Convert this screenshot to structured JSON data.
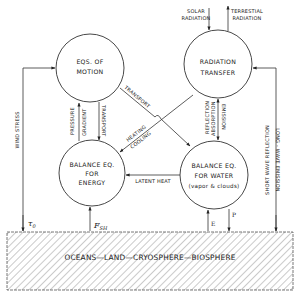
{
  "diagram": {
    "nodes": {
      "motion": {
        "line1": "EQS. OF",
        "line2": "MOTION"
      },
      "radiation": {
        "line1": "RADIATION",
        "line2": "TRANSFER"
      },
      "energy": {
        "line1": "BALANCE EQ.",
        "line2": "FOR",
        "line3": "ENERGY"
      },
      "water": {
        "line1": "BALANCE EQ.",
        "line2": "FOR WATER",
        "line3": "(vapor & clouds)"
      }
    },
    "external": {
      "solar": {
        "line1": "SOLAR",
        "line2": "RADIATION"
      },
      "terrestrial": {
        "line1": "TERRESTIAL",
        "line2": "RADIATION"
      }
    },
    "edges": {
      "pressure": "PRESSURE",
      "gradient": "GRADIENT",
      "transport_vertical": "TRANSPORT",
      "transport_diagonal": "TRANSPORT",
      "heating": "HEATING",
      "cooling": "COOLING",
      "reflection": "REFLECTION",
      "absorption": "ABSORPTION",
      "emission": "EMISSION",
      "latent_heat": "LATENT HEAT",
      "wind_stress": "WIND STRESS",
      "short_wave": "SHORT WAVE REFLECTION",
      "long_wave": "LONG - WAVE EMISSION"
    },
    "symbols": {
      "tau": "τ",
      "tau_sub": "0",
      "f": "F",
      "f_sub": "SH",
      "e": "E",
      "p": "P"
    },
    "ground": {
      "label": "OCEANS—LAND—CRYOSPHERE—BIOSPHERE"
    }
  }
}
